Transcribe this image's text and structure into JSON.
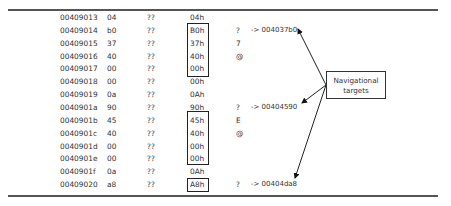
{
  "rows": [
    {
      "addr": "00409013",
      "byte": "04",
      "q": "??",
      "hex": "04h",
      "char": "",
      "ref": ""
    },
    {
      "addr": "00409014",
      "byte": "b0",
      "q": "??",
      "hex": "B0h",
      "char": "?",
      "ref": "-> 004037b0"
    },
    {
      "addr": "00409015",
      "byte": "37",
      "q": "??",
      "hex": "37h",
      "char": "7",
      "ref": ""
    },
    {
      "addr": "00409016",
      "byte": "40",
      "q": "??",
      "hex": "40h",
      "char": "@",
      "ref": ""
    },
    {
      "addr": "00409017",
      "byte": "00",
      "q": "??",
      "hex": "00h",
      "char": "",
      "ref": ""
    },
    {
      "addr": "00409018",
      "byte": "00",
      "q": "??",
      "hex": "00h",
      "char": "",
      "ref": ""
    },
    {
      "addr": "00409019",
      "byte": "0a",
      "q": "??",
      "hex": "0Ah",
      "char": "",
      "ref": ""
    },
    {
      "addr": "0040901a",
      "byte": "90",
      "q": "??",
      "hex": "90h",
      "char": "?",
      "ref": "-> 00404590"
    },
    {
      "addr": "0040901b",
      "byte": "45",
      "q": "??",
      "hex": "45h",
      "char": "E",
      "ref": ""
    },
    {
      "addr": "0040901c",
      "byte": "40",
      "q": "??",
      "hex": "40h",
      "char": "@",
      "ref": ""
    },
    {
      "addr": "0040901d",
      "byte": "00",
      "q": "??",
      "hex": "00h",
      "char": "",
      "ref": ""
    },
    {
      "addr": "0040901e",
      "byte": "00",
      "q": "??",
      "hex": "00h",
      "char": "",
      "ref": ""
    },
    {
      "addr": "0040901f",
      "byte": "0a",
      "q": "??",
      "hex": "0Ah",
      "char": "",
      "ref": ""
    },
    {
      "addr": "00409020",
      "byte": "a8",
      "q": "??",
      "hex": "A8h",
      "char": "?",
      "ref": "-> 00404da8"
    }
  ],
  "callout": {
    "line1": "Navigational",
    "line2": "targets"
  },
  "colors": {
    "rule": "#555555",
    "text": "#333333",
    "box": "#222222"
  }
}
